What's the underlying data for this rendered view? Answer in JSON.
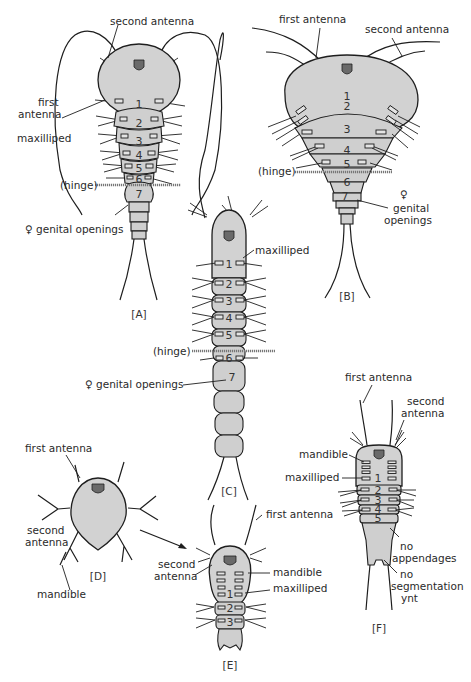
{
  "figure": {
    "colors": {
      "body_fill": "#d2d2d2",
      "outline": "#1e1e1e",
      "background": "#ffffff",
      "hinge": "#777777"
    },
    "panels": {
      "A": {
        "label": "[A]",
        "annotations": {
          "second_antenna": "second antenna",
          "first_antenna_l1": "first",
          "first_antenna_l2": "antenna",
          "maxilliped": "maxilliped",
          "hinge": "(hinge)",
          "genital": "♀ genital openings"
        },
        "segments": [
          "1",
          "2",
          "3",
          "4",
          "5",
          "6",
          "7"
        ]
      },
      "B": {
        "label": "[B]",
        "annotations": {
          "first_antenna": "first antenna",
          "second_antenna": "second antenna",
          "hinge": "(hinge)",
          "female": "♀",
          "genital_l1": "genital",
          "genital_l2": "openings"
        },
        "segments": [
          "1",
          "2",
          "3",
          "4",
          "5",
          "6",
          "7"
        ]
      },
      "C": {
        "label": "[C]",
        "annotations": {
          "maxilliped": "maxilliped",
          "hinge": "(hinge)",
          "genital": "♀ genital openings"
        },
        "segments": [
          "1",
          "2",
          "3",
          "4",
          "5",
          "6",
          "7"
        ]
      },
      "D": {
        "label": "[D]",
        "annotations": {
          "first_antenna": "first antenna",
          "second_antenna_l1": "second",
          "second_antenna_l2": "antenna",
          "mandible": "mandible"
        }
      },
      "E": {
        "label": "[E]",
        "annotations": {
          "first_antenna": "first antenna",
          "second_antenna_l1": "second",
          "second_antenna_l2": "antenna",
          "mandible": "mandible",
          "maxilliped": "maxilliped"
        },
        "segments": [
          "1",
          "2",
          "3"
        ]
      },
      "F": {
        "label": "[F]",
        "annotations": {
          "first_antenna": "first antenna",
          "second_antenna_l1": "second",
          "second_antenna_l2": "antenna",
          "mandible": "mandible",
          "maxilliped": "maxilliped",
          "no_app_l1": "no",
          "no_app_l2": "appendages",
          "no_seg_l1": "no",
          "no_seg_l2": "segmentation",
          "no_seg_l3": "ynt"
        },
        "segments": [
          "1",
          "2",
          "3",
          "4",
          "5"
        ]
      }
    }
  }
}
